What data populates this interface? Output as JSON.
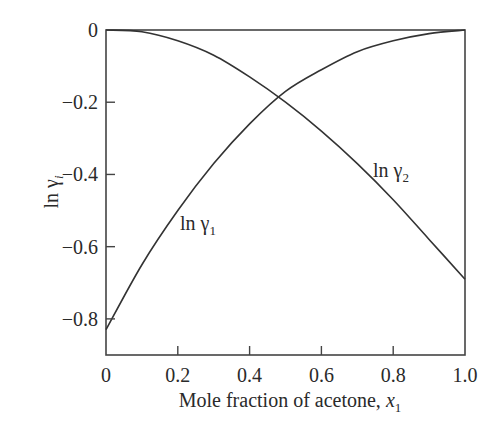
{
  "chart_data": {
    "type": "line",
    "title": "",
    "xlabel": "Mole fraction of acetone, x1",
    "xlabel_main": "Mole fraction of acetone, ",
    "xlabel_var": "x",
    "xlabel_sub": "1",
    "ylabel": "ln γi",
    "ylabel_main": "ln γ",
    "ylabel_sub": "i",
    "xlim": [
      0,
      1.0
    ],
    "ylim": [
      -0.9,
      0
    ],
    "x_ticks": [
      "0",
      "0.2",
      "0.4",
      "0.6",
      "0.8",
      "1.0"
    ],
    "y_ticks": [
      "0",
      "−0.2",
      "−0.4",
      "−0.6",
      "−0.8"
    ],
    "grid": false,
    "legend": "inline curve labels",
    "x": [
      0,
      0.1,
      0.2,
      0.3,
      0.4,
      0.5,
      0.6,
      0.7,
      0.8,
      0.9,
      1.0
    ],
    "series": [
      {
        "name": "ln γ1",
        "label_main": "ln γ",
        "label_sub": "1",
        "values": [
          -0.83,
          -0.65,
          -0.5,
          -0.37,
          -0.26,
          -0.17,
          -0.11,
          -0.06,
          -0.03,
          -0.01,
          0.0
        ]
      },
      {
        "name": "ln γ2",
        "label_main": "ln γ",
        "label_sub": "2",
        "values": [
          0.0,
          -0.005,
          -0.03,
          -0.07,
          -0.13,
          -0.2,
          -0.28,
          -0.37,
          -0.47,
          -0.58,
          -0.69
        ]
      }
    ],
    "annotations": [
      {
        "text": "ln γ1",
        "x": 0.2,
        "y": -0.57
      },
      {
        "text": "ln γ2",
        "x": 0.74,
        "y": -0.42
      }
    ],
    "intersection": {
      "x": 0.48,
      "y": -0.19
    }
  },
  "colors": {
    "line": "#333333",
    "axis": "#444444",
    "text": "#2a2a2a",
    "background": "#ffffff"
  }
}
